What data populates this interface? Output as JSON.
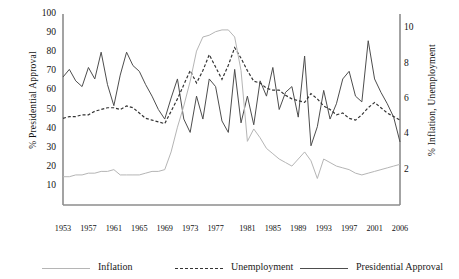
{
  "chart_data": {
    "type": "line",
    "title": "",
    "xlabel": "",
    "ylabel": "% Presidential Approval",
    "y2label": "% Inflation, Unemployment",
    "grid": false,
    "legend_position": "bottom",
    "ylim": [
      0,
      100
    ],
    "y2lim": [
      0,
      10.8
    ],
    "yticks": [
      10,
      20,
      30,
      40,
      50,
      60,
      70,
      80,
      90,
      100
    ],
    "y2ticks": [
      2,
      4,
      6,
      8,
      10
    ],
    "xticks": [
      "1953",
      "1957",
      "1961",
      "1965",
      "1969",
      "1973",
      "1977",
      "1981",
      "1985",
      "1989",
      "1993",
      "1997",
      "2001",
      "2006"
    ],
    "x": [
      1953,
      1954,
      1955,
      1956,
      1957,
      1958,
      1959,
      1960,
      1961,
      1962,
      1963,
      1964,
      1965,
      1966,
      1967,
      1968,
      1969,
      1970,
      1971,
      1972,
      1973,
      1974,
      1975,
      1976,
      1977,
      1978,
      1979,
      1980,
      1981,
      1982,
      1983,
      1984,
      1985,
      1986,
      1987,
      1988,
      1989,
      1990,
      1991,
      1992,
      1993,
      1994,
      1995,
      1996,
      1997,
      1998,
      1999,
      2000,
      2001,
      2002,
      2003,
      2004,
      2005,
      2006
    ],
    "series": [
      {
        "name": "Presidential Approval",
        "axis": "left",
        "style": "solid",
        "color": "#4d4d4d",
        "values": [
          67,
          71,
          65,
          62,
          72,
          66,
          80,
          63,
          52,
          68,
          80,
          73,
          70,
          63,
          57,
          50,
          45,
          56,
          66,
          45,
          38,
          57,
          45,
          66,
          62,
          44,
          38,
          71,
          43,
          57,
          42,
          65,
          57,
          72,
          50,
          59,
          62,
          46,
          78,
          31,
          41,
          60,
          45,
          53,
          66,
          70,
          57,
          54,
          86,
          66,
          59,
          53,
          46,
          33
        ]
      },
      {
        "name": "Unemployment",
        "axis": "right",
        "style": "dashed",
        "color": "#333333",
        "values": [
          4.9,
          5.0,
          5.0,
          5.1,
          5.1,
          5.3,
          5.4,
          5.5,
          5.5,
          5.4,
          5.6,
          5.5,
          5.2,
          4.9,
          4.8,
          4.7,
          4.6,
          5.3,
          6.0,
          6.8,
          7.6,
          6.9,
          7.6,
          8.5,
          7.8,
          7.1,
          7.9,
          8.9,
          8.3,
          7.6,
          7.0,
          6.9,
          6.6,
          6.5,
          6.5,
          6.2,
          6.0,
          5.9,
          5.8,
          6.3,
          6.0,
          5.6,
          5.4,
          5.1,
          5.2,
          4.9,
          4.8,
          5.1,
          5.5,
          5.8,
          5.5,
          5.2,
          5.0,
          4.8
        ]
      },
      {
        "name": "Inflation",
        "axis": "right",
        "style": "solid",
        "color": "#b5b5b5",
        "values": [
          1.6,
          1.6,
          1.7,
          1.7,
          1.8,
          1.8,
          1.9,
          1.9,
          2.0,
          1.7,
          1.7,
          1.7,
          1.7,
          1.8,
          1.9,
          1.9,
          2.0,
          3.0,
          4.4,
          5.6,
          7.0,
          8.7,
          9.5,
          9.6,
          9.8,
          9.9,
          9.9,
          9.5,
          7.6,
          3.6,
          4.3,
          3.8,
          3.2,
          2.9,
          2.6,
          2.4,
          2.2,
          2.6,
          3.0,
          2.5,
          1.5,
          2.6,
          2.4,
          2.2,
          2.1,
          2.0,
          1.8,
          1.7,
          1.8,
          1.9,
          2.0,
          2.1,
          2.2,
          2.3
        ]
      }
    ],
    "legend": [
      {
        "label": "Inflation",
        "style": "solid",
        "color": "#b5b5b5"
      },
      {
        "label": "Unemployment",
        "style": "dashed",
        "color": "#333333"
      },
      {
        "label": "Presidential Approval",
        "style": "solid",
        "color": "#4d4d4d"
      }
    ]
  }
}
